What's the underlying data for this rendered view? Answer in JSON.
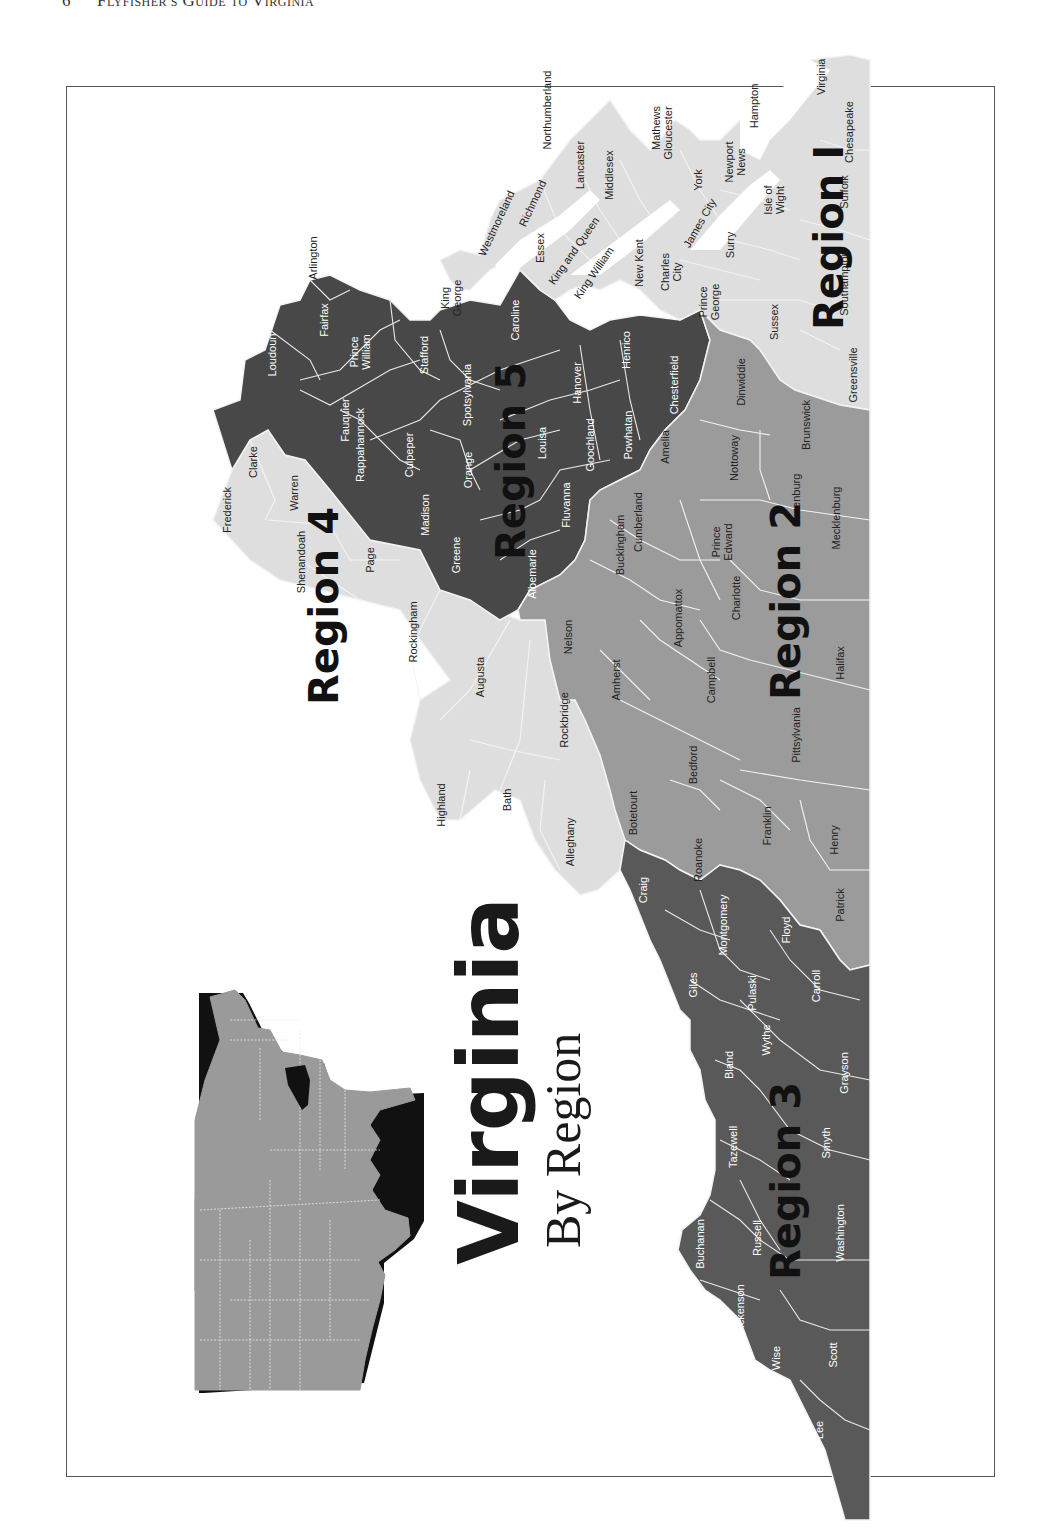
{
  "page": {
    "page_number": "6",
    "running_head": "Flyfisher's Guide to Virginia"
  },
  "title": {
    "main": "Virginia",
    "sub": "By Region"
  },
  "colors": {
    "region_1": "#dedede",
    "region_2": "#9b9b9b",
    "region_3": "#595959",
    "region_4": "#dedede",
    "region_5": "#484848",
    "county_border": "#f2f2f2",
    "inset_us": "#9a9a9a",
    "inset_highlight": "#111111"
  },
  "regions": [
    {
      "label": "Region 1",
      "counties": [
        "Virginia Beach",
        "Chesapeake",
        "Suffolk",
        "Southampton",
        "Isle of Wight",
        "Hampton",
        "Newport News",
        "York",
        "James City",
        "Surry",
        "Sussex",
        "Greensville",
        "Prince George",
        "Charles City",
        "New Kent",
        "King William",
        "King and Queen",
        "Essex",
        "Middlesex",
        "Mathews",
        "Gloucester",
        "Lancaster",
        "Northumberland",
        "Richmond",
        "Westmoreland",
        "King George"
      ]
    },
    {
      "label": "Region 2",
      "counties": [
        "Dinwiddie",
        "Brunswick",
        "Nottoway",
        "Amelia",
        "Lunenburg",
        "Mecklenburg",
        "Prince Edward",
        "Cumberland",
        "Buckingham",
        "Charlotte",
        "Appomattox",
        "Halifax",
        "Campbell",
        "Amherst",
        "Nelson",
        "Pittsylvania",
        "Bedford",
        "Botetourt",
        "Franklin",
        "Roanoke",
        "Henry",
        "Patrick"
      ]
    },
    {
      "label": "Region 3",
      "counties": [
        "Craig",
        "Montgomery",
        "Floyd",
        "Giles",
        "Pulaski",
        "Carroll",
        "Bland",
        "Wythe",
        "Grayson",
        "Tazewell",
        "Smyth",
        "Buchanan",
        "Russell",
        "Washington",
        "Dickenson",
        "Wise",
        "Scott",
        "Lee"
      ]
    },
    {
      "label": "Region 4",
      "counties": [
        "Frederick",
        "Clarke",
        "Warren",
        "Shenandoah",
        "Page",
        "Rockingham",
        "Augusta",
        "Rockbridge",
        "Highland",
        "Bath",
        "Alleghany"
      ]
    },
    {
      "label": "Region 5",
      "counties": [
        "Arlington",
        "Fairfax",
        "Loudoun",
        "Prince William",
        "Stafford",
        "Fauquier",
        "Rappahannock",
        "Culpeper",
        "Madison",
        "Orange",
        "Spotsylvania",
        "Caroline",
        "Greene",
        "Albemarle",
        "Louisa",
        "Hanover",
        "Henrico",
        "Fluvanna",
        "Goochland",
        "Powhatan",
        "Chesterfield"
      ]
    }
  ],
  "labels": {
    "virginia_beach": "Virginia",
    "chesapeake": "Chesapeake",
    "hampton": "Hampton",
    "suffolk": "Suffolk",
    "newport_news_1": "Newport",
    "newport_news_2": "News",
    "isle_of_wight_1": "Isle of",
    "isle_of_wight_2": "Wight",
    "southampton": "Southampton",
    "york": "York",
    "mathews": "Mathews",
    "gloucester": "Gloucester",
    "james_city": "James City",
    "surry": "Surry",
    "sussex": "Sussex",
    "greensville": "Greensville",
    "northumberland": "Northumberland",
    "lancaster": "Lancaster",
    "middlesex": "Middlesex",
    "richmond": "Richmond",
    "westmoreland": "Westmoreland",
    "essex": "Essex",
    "king_and_queen": "King and Queen",
    "king_william": "King William",
    "new_kent": "New Kent",
    "charles_city_1": "Charles",
    "charles_city_2": "City",
    "prince_george_1": "Prince",
    "prince_george_2": "George",
    "king_george_1": "King",
    "king_george_2": "George",
    "arlington": "Arlington",
    "fairfax": "Fairfax",
    "loudoun": "Loudoun",
    "prince_william_1": "Prince",
    "prince_william_2": "William",
    "stafford": "Stafford",
    "caroline": "Caroline",
    "fauquier": "Fauquier",
    "rappahannock": "Rappahannock",
    "culpeper": "Culpeper",
    "spotsylvania": "Spotsylvania",
    "orange": "Orange",
    "madison": "Madison",
    "greene": "Greene",
    "albemarle": "Albemarle",
    "louisa": "Louisa",
    "hanover": "Hanover",
    "henrico": "Henrico",
    "fluvanna": "Fluvanna",
    "goochland": "Goochland",
    "powhatan": "Powhatan",
    "chesterfield": "Chesterfield",
    "amelia": "Amelia",
    "dinwiddie": "Dinwiddie",
    "nottoway": "Nottoway",
    "brunswick": "Brunswick",
    "lunenburg": "Lunenburg",
    "mecklenburg": "Mecklenburg",
    "prince_edward_1": "Prince",
    "prince_edward_2": "Edward",
    "cumberland": "Cumberland",
    "buckingham": "Buckingham",
    "charlotte": "Charlotte",
    "appomattox": "Appomattox",
    "halifax": "Halifax",
    "campbell": "Campbell",
    "amherst": "Amherst",
    "nelson": "Nelson",
    "pittsylvania": "Pittsylvania",
    "bedford": "Bedford",
    "botetourt": "Botetourt",
    "franklin": "Franklin",
    "roanoke": "Roanoke",
    "henry": "Henry",
    "patrick": "Patrick",
    "frederick": "Frederick",
    "clarke": "Clarke",
    "warren": "Warren",
    "shenandoah": "Shenandoah",
    "page": "Page",
    "rockingham": "Rockingham",
    "augusta": "Augusta",
    "rockbridge": "Rockbridge",
    "highland": "Highland",
    "bath": "Bath",
    "alleghany": "Alleghany",
    "craig": "Craig",
    "montgomery": "Montgomery",
    "floyd": "Floyd",
    "giles": "Giles",
    "pulaski": "Pulaski",
    "carroll": "Carroll",
    "bland": "Bland",
    "wythe": "Wythe",
    "grayson": "Grayson",
    "tazewell": "Tazewell",
    "smyth": "Smyth",
    "buchanan": "Buchanan",
    "russell": "Russell",
    "washington": "Washington",
    "dickenson": "Dickenson",
    "wise": "Wise",
    "scott": "Scott",
    "lee": "Lee"
  },
  "region_labels": {
    "r1": "Region I",
    "r2": "Region 2",
    "r3": "Region 3",
    "r4": "Region 4",
    "r5": "Region 5"
  },
  "inset": {
    "description": "Outline map of the eastern United States with Virginia highlighted"
  }
}
